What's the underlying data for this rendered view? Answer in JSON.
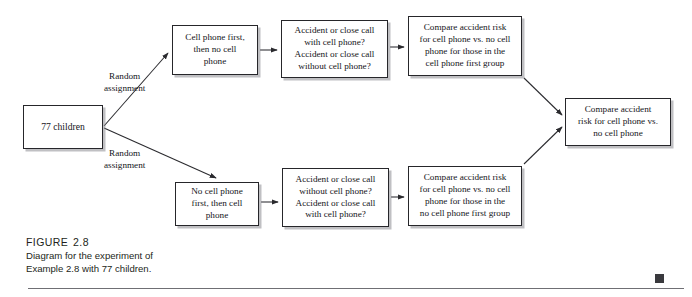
{
  "figure": {
    "label": "FIGURE",
    "number": "2.8",
    "caption_line_1": "Diagram for the experiment of",
    "caption_line_2": "Example 2.8 with 77 children."
  },
  "diagram": {
    "type": "flowchart",
    "source": {
      "text": "77 children"
    },
    "edge_labels": {
      "random_top": "Random\nassignment",
      "random_top_line_1": "Random",
      "random_top_line_2": "assignment",
      "random_bottom_line_1": "Random",
      "random_bottom_line_2": "assignment"
    },
    "branches": [
      {
        "name": "cell-phone-first",
        "treatment": {
          "line_1": "Cell phone first,",
          "line_2": "then no cell",
          "line_3": "phone"
        },
        "measurement": {
          "line_1": "Accident or close call",
          "line_2": "with cell phone?",
          "line_3": "Accident or close call",
          "line_4": "without cell phone?"
        },
        "comparison": {
          "line_1": "Compare accident risk",
          "line_2": "for cell phone vs. no cell",
          "line_3": "phone for those in the",
          "line_4": "cell phone first group"
        }
      },
      {
        "name": "no-cell-phone-first",
        "treatment": {
          "line_1": "No cell phone",
          "line_2": "first, then cell",
          "line_3": "phone"
        },
        "measurement": {
          "line_1": "Accident or close call",
          "line_2": "without cell phone?",
          "line_3": "Accident or close call",
          "line_4": "with cell phone?"
        },
        "comparison": {
          "line_1": "Compare accident risk",
          "line_2": "for cell phone vs. no cell",
          "line_3": "phone for those in the",
          "line_4": "no cell phone first group"
        }
      }
    ],
    "merge": {
      "line_1": "Compare accident",
      "line_2": "risk for cell phone vs.",
      "line_3": "no cell phone"
    }
  },
  "colors": {
    "box_border": "#26262a",
    "box_fill": "#ffffff",
    "box_shadow": "#8c8c91",
    "arrow": "#2a2a2e",
    "text": "#15151a",
    "caption_text": "#231f20",
    "rule": "#6f6f74",
    "corner_mark": "#3a3a3e"
  }
}
